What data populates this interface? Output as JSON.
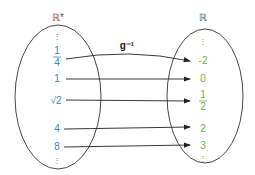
{
  "diagram": {
    "domain_label": "ℝ*",
    "codomain_label": "ℝ",
    "function_label": "g⁻¹",
    "colors": {
      "domain": "#3b86c6",
      "codomain": "#6ab04c",
      "line": "#222222"
    },
    "domain_top_dots": "⋮",
    "domain_bottom_dots": "⋮",
    "codomain_top_dots": "⋮",
    "codomain_bottom_dots": "⋮",
    "mappings": [
      {
        "from": "1/4",
        "from_num": "1",
        "from_den": "4",
        "to": "-2"
      },
      {
        "from": "1",
        "to": "0"
      },
      {
        "from": "√2",
        "to": "1/2",
        "to_num": "1",
        "to_den": "2"
      },
      {
        "from": "4",
        "to": "2"
      },
      {
        "from": "8",
        "to": "3"
      }
    ]
  }
}
